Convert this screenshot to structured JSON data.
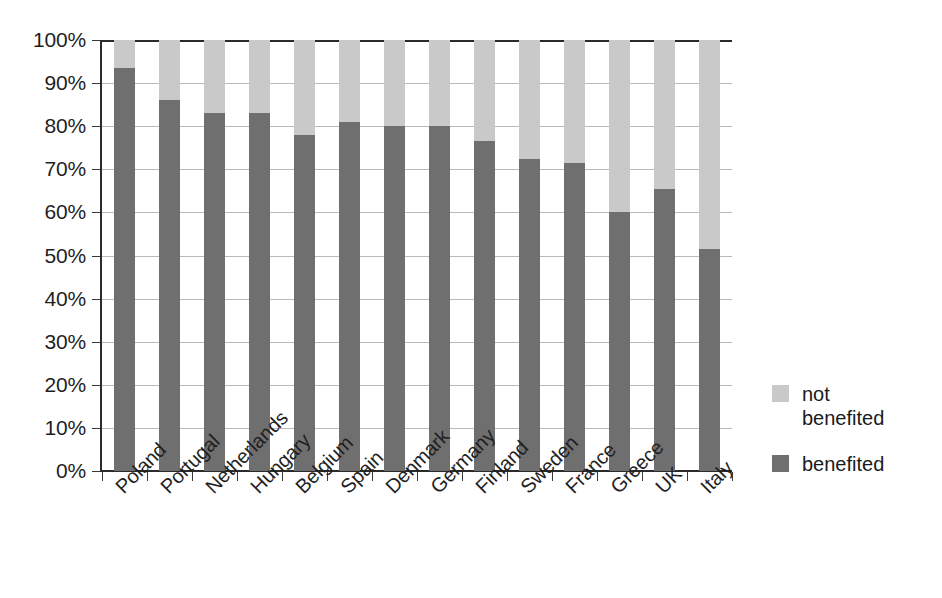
{
  "chart_data": {
    "type": "bar",
    "subtype": "stacked-100-percent",
    "title": "",
    "xlabel": "",
    "ylabel": "",
    "ylim": [
      0,
      100
    ],
    "grid": true,
    "legend_position": "right",
    "y_tick_labels": [
      "100%",
      "90%",
      "80%",
      "70%",
      "60%",
      "50%",
      "40%",
      "30%",
      "20%",
      "10%",
      "0%"
    ],
    "y_ticks": [
      100,
      90,
      80,
      70,
      60,
      50,
      40,
      30,
      20,
      10,
      0
    ],
    "categories": [
      "Poland",
      "Portugal",
      "Netherlands",
      "Hungary",
      "Belgium",
      "Spain",
      "Denmark",
      "Germany",
      "Finland",
      "Sweden",
      "France",
      "Greece",
      "UK",
      "Italy"
    ],
    "series": [
      {
        "name": "benefited",
        "color": "#6f6f6f",
        "values": [
          93.5,
          86.0,
          83.0,
          83.0,
          78.0,
          81.0,
          80.0,
          80.0,
          76.5,
          72.5,
          71.5,
          60.0,
          65.5,
          51.5
        ]
      },
      {
        "name": "not benefited",
        "color": "#c9c9c9",
        "values": [
          6.5,
          14.0,
          17.0,
          17.0,
          22.0,
          19.0,
          20.0,
          20.0,
          23.5,
          27.5,
          28.5,
          40.0,
          34.5,
          48.5
        ]
      }
    ]
  },
  "legend": {
    "items": [
      {
        "label": "not\nbenefited",
        "color": "#c9c9c9",
        "key": "not-benefited"
      },
      {
        "label": "benefited",
        "color": "#6f6f6f",
        "key": "benefited"
      }
    ]
  },
  "colors": {
    "benefited": "#6f6f6f",
    "not_benefited": "#c9c9c9",
    "axis": "#2b2b2b",
    "gridline": "#b9b9b9",
    "background": "#ffffff",
    "text": "#1a1a1a"
  }
}
